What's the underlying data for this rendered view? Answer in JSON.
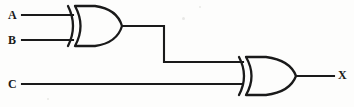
{
  "diagram": {
    "background_color": "#fdfdfc",
    "line_color": "#1a1a1a",
    "width": 354,
    "height": 107,
    "inputs": [
      {
        "id": "A",
        "label": "A",
        "label_x": 8,
        "label_y": 9,
        "wire_y": 15
      },
      {
        "id": "B",
        "label": "B",
        "label_x": 8,
        "label_y": 34,
        "wire_y": 40
      },
      {
        "id": "C",
        "label": "C",
        "label_x": 8,
        "label_y": 78,
        "wire_y": 84
      }
    ],
    "outputs": [
      {
        "id": "X",
        "label": "X",
        "label_x": 338,
        "label_y": 69,
        "wire_y": 76
      }
    ],
    "gates": [
      {
        "id": "gate1",
        "type": "XOR",
        "label": "XOR gate 1",
        "inputs": [
          "A",
          "B"
        ],
        "output": "net1",
        "x": 68,
        "y": 6,
        "width": 54,
        "height": 40
      },
      {
        "id": "gate2",
        "type": "XOR",
        "label": "XOR gate 2",
        "inputs": [
          "net1",
          "C"
        ],
        "output": "X",
        "x": 238,
        "y": 57,
        "width": 58,
        "height": 38
      }
    ],
    "nets": [
      {
        "id": "net_a",
        "from": "A",
        "to": "gate1.in0"
      },
      {
        "id": "net_b",
        "from": "B",
        "to": "gate1.in1"
      },
      {
        "id": "net1",
        "from": "gate1.out",
        "to": "gate2.in0"
      },
      {
        "id": "net_c",
        "from": "C",
        "to": "gate2.in1"
      },
      {
        "id": "net_x",
        "from": "gate2.out",
        "to": "X"
      }
    ],
    "expression": "X = (A XOR B) XOR C"
  }
}
